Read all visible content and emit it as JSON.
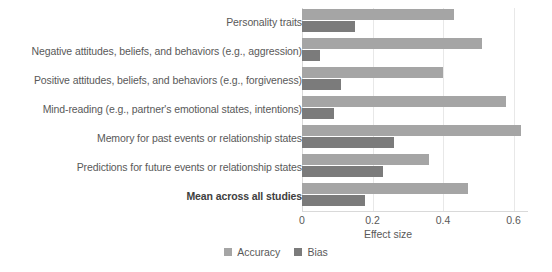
{
  "chart_data": {
    "type": "bar",
    "orientation": "horizontal",
    "title": "",
    "xlabel": "Effect size",
    "ylabel": "",
    "xlim": [
      0,
      0.8
    ],
    "xticks": [
      "0",
      "0.2",
      "0.4",
      "0.6",
      "0.8"
    ],
    "grid": true,
    "legend_position": "bottom",
    "categories": [
      "Personality traits",
      "Negative attitudes, beliefs, and behaviors (e.g., aggression)",
      "Positive attitudes, beliefs, and behaviors (e.g., forgiveness)",
      "Mind-reading (e.g., partner's emotional states, intentions)",
      "Memory for past events or relationship states",
      "Predictions for future events or relationship states",
      "Mean across all studies"
    ],
    "emphasized_category": "Mean across all studies",
    "series": [
      {
        "name": "Accuracy",
        "color": "#a5a5a5",
        "values": [
          0.43,
          0.51,
          0.4,
          0.58,
          0.62,
          0.36,
          0.47
        ]
      },
      {
        "name": "Bias",
        "color": "#7b7b7b",
        "values": [
          0.15,
          0.05,
          0.11,
          0.09,
          0.26,
          0.23,
          0.18
        ]
      }
    ]
  },
  "axis": {
    "x_title": "Effect size"
  },
  "legend": {
    "items": [
      {
        "label": "Accuracy",
        "color": "#a5a5a5"
      },
      {
        "label": "Bias",
        "color": "#7b7b7b"
      }
    ]
  }
}
